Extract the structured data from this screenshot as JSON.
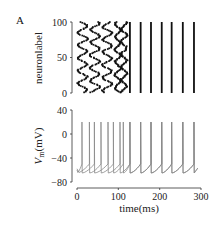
{
  "panel_label": "A",
  "chart_data": [
    {
      "type": "scatter",
      "title": "Raster plot",
      "xlabel": "",
      "ylabel": "neuronlabel",
      "xlim": [
        0,
        300
      ],
      "ylim": [
        0,
        100
      ],
      "yticks": [
        0,
        50,
        100
      ],
      "ytick_labels": [
        "0",
        "50",
        "100"
      ],
      "description": "Spike raster of 100 neurons; scattered spikes in first ~125 ms gradually synchronize into aligned vertical columns",
      "synchronized_spike_times_ms": [
        128,
        154,
        179,
        205,
        229,
        256,
        283
      ],
      "desynchronized_clusters_ms": [
        [
          0,
          25
        ],
        [
          30,
          55
        ],
        [
          60,
          85
        ],
        [
          90,
          105
        ],
        [
          105,
          120
        ]
      ]
    },
    {
      "type": "line",
      "title": "Membrane potential",
      "xlabel": "time(ms)",
      "ylabel": "V_m(mV)",
      "xlim": [
        0,
        300
      ],
      "ylim": [
        -80,
        40
      ],
      "xticks": [
        0,
        100,
        200,
        300
      ],
      "xtick_labels": [
        "0",
        "100",
        "200",
        "300"
      ],
      "yticks": [
        -80,
        -40,
        0,
        40
      ],
      "ytick_labels": [
        "−80",
        "−40",
        "0",
        "40"
      ],
      "series": [
        {
          "name": "neuron 1",
          "spike_times_ms": [
            12,
            42,
            75,
            104,
            128,
            154,
            179,
            205,
            229,
            256,
            283
          ],
          "spike_peak_mV": 20,
          "reset_mV": -65
        },
        {
          "name": "neuron 2",
          "spike_times_ms": [
            30,
            58,
            88,
            112,
            128,
            154,
            179,
            205,
            229,
            256,
            283
          ],
          "spike_peak_mV": 20,
          "reset_mV": -65
        }
      ]
    }
  ],
  "labels": {
    "raster_ylabel": "neuronlabel",
    "vm_ylabel_main": "V",
    "vm_ylabel_sub": "m",
    "vm_ylabel_unit": "(mV)",
    "xlabel": "time(ms)",
    "raster_yticks": [
      "100",
      "50",
      "0"
    ],
    "vm_yticks": [
      "40",
      "0",
      "−40",
      "−80"
    ],
    "xticks": [
      "0",
      "100",
      "200",
      "300"
    ]
  }
}
